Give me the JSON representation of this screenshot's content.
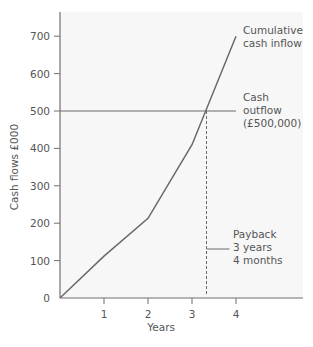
{
  "chart_data": {
    "type": "line",
    "title": "",
    "xlabel": "Years",
    "ylabel": "Cash flows £000",
    "x_ticks": [
      1,
      2,
      3,
      4
    ],
    "y_ticks": [
      0,
      100,
      200,
      300,
      400,
      500,
      600,
      700
    ],
    "xlim": [
      0,
      5.5
    ],
    "ylim": [
      0,
      760
    ],
    "grid": false,
    "series": [
      {
        "name": "Cumulative cash inflow",
        "x": [
          0,
          1,
          2,
          3,
          4
        ],
        "values": [
          0,
          112,
          213,
          410,
          700
        ]
      }
    ],
    "reference_lines": [
      {
        "type": "horizontal",
        "y": 500,
        "x_end": 4,
        "label": "Cash outflow (£500,000)"
      },
      {
        "type": "vertical",
        "x": 3.33,
        "style": "dashed",
        "label": "Payback 3 years 4 months"
      }
    ],
    "annotations": [
      {
        "text": [
          "Cumulative",
          "cash inflow"
        ],
        "at": "end of series"
      },
      {
        "text": [
          "Cash",
          "outflow",
          "(£500,000)"
        ],
        "at": "outflow line"
      },
      {
        "text": [
          "Payback",
          "3 years",
          "4 months"
        ],
        "at": "payback marker"
      }
    ]
  },
  "labels": {
    "ylabel": "Cash flows £000",
    "xlabel": "Years",
    "inflow": [
      "Cumulative",
      "cash inflow"
    ],
    "outflow": [
      "Cash",
      "outflow",
      "(£500,000)"
    ],
    "payback": [
      "Payback",
      "3 years",
      "4 months"
    ]
  },
  "colors": {
    "plot_bg": "#f7f7f7",
    "axis": "#707070",
    "line": "#6a6a6a",
    "text": "#555555"
  }
}
